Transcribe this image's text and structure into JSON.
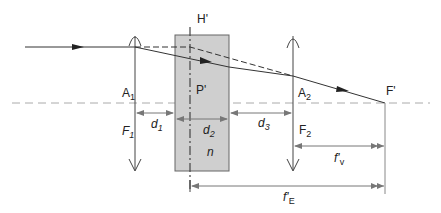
{
  "diagram": {
    "type": "optical-system",
    "colors": {
      "line": "#333333",
      "axis_dash": "#aaaaaa",
      "plate_fill": "#cfcfcf",
      "plate_stroke": "#666666",
      "dim_line": "#777777"
    },
    "labels": {
      "H_prime": "H'",
      "P_prime": "P'",
      "F_prime": "F'",
      "A1": "A",
      "A1_sub": "1",
      "A2": "A",
      "A2_sub": "2",
      "F1": "F",
      "F1_sub": "1",
      "F2": "F",
      "F2_sub": "2",
      "d1": "d",
      "d1_sub": "1",
      "d2": "d",
      "d2_sub": "2",
      "d3": "d",
      "d3_sub": "3",
      "n": "n",
      "fv": "f'",
      "fv_sub": "v",
      "fE": "f'",
      "fE_sub": "E"
    },
    "elements": [
      {
        "name": "lens-1",
        "kind": "converging-lens",
        "labels": [
          "A1",
          "F1"
        ]
      },
      {
        "name": "glass-plate",
        "kind": "plate",
        "labels": [
          "P'",
          "d2",
          "n"
        ]
      },
      {
        "name": "principal-plane",
        "kind": "dashed-line",
        "labels": [
          "H'"
        ]
      },
      {
        "name": "lens-2",
        "kind": "converging-lens",
        "labels": [
          "A2",
          "F2"
        ]
      },
      {
        "name": "focal-point",
        "kind": "point",
        "labels": [
          "F'"
        ]
      }
    ],
    "dimensions": [
      {
        "label": "d1",
        "from": "lens-1",
        "to": "plate-front"
      },
      {
        "label": "d2",
        "from": "plate-front",
        "to": "plate-back"
      },
      {
        "label": "d3",
        "from": "plate-back",
        "to": "lens-2"
      },
      {
        "label": "f'v",
        "from": "lens-2",
        "to": "F'"
      },
      {
        "label": "f'E",
        "from": "H'",
        "to": "F'"
      }
    ]
  }
}
